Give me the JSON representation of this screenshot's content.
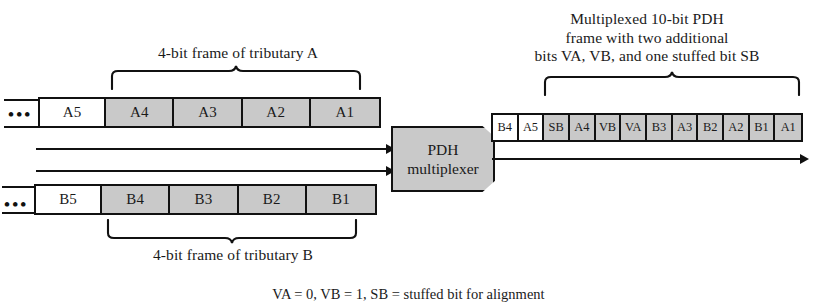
{
  "diagram": {
    "colors": {
      "bit_fill_gray": "#c9c9c9",
      "bit_fill_white": "#ffffff",
      "line": "#111111",
      "background": "#ffffff"
    }
  },
  "tributary_a": {
    "brace_label": "4-bit frame of tributary A",
    "ellipsis": "•••",
    "cells": [
      {
        "label": "A5",
        "shaded": false
      },
      {
        "label": "A4",
        "shaded": true
      },
      {
        "label": "A3",
        "shaded": true
      },
      {
        "label": "A2",
        "shaded": true
      },
      {
        "label": "A1",
        "shaded": true
      }
    ]
  },
  "tributary_b": {
    "brace_label": "4-bit frame of tributary B",
    "ellipsis": "•••",
    "cells": [
      {
        "label": "B5",
        "shaded": false
      },
      {
        "label": "B4",
        "shaded": true
      },
      {
        "label": "B3",
        "shaded": true
      },
      {
        "label": "B2",
        "shaded": true
      },
      {
        "label": "B1",
        "shaded": true
      }
    ]
  },
  "multiplexer": {
    "line1": "PDH",
    "line2": "multiplexer"
  },
  "output_frame": {
    "caption_line1": "Multiplexed 10-bit PDH",
    "caption_line2": "frame with two additional",
    "caption_line3": "bits VA, VB, and one stuffed bit SB",
    "cells": [
      {
        "label": "B4",
        "shaded": false
      },
      {
        "label": "A5",
        "shaded": false
      },
      {
        "label": "SB",
        "shaded": true
      },
      {
        "label": "A4",
        "shaded": true
      },
      {
        "label": "VB",
        "shaded": true
      },
      {
        "label": "VA",
        "shaded": true
      },
      {
        "label": "B3",
        "shaded": true
      },
      {
        "label": "A3",
        "shaded": true
      },
      {
        "label": "B2",
        "shaded": true
      },
      {
        "label": "A2",
        "shaded": true
      },
      {
        "label": "B1",
        "shaded": true
      },
      {
        "label": "A1",
        "shaded": true
      }
    ]
  },
  "footnote": {
    "text": "VA = 0, VB = 1, SB = stuffed bit for alignment"
  }
}
